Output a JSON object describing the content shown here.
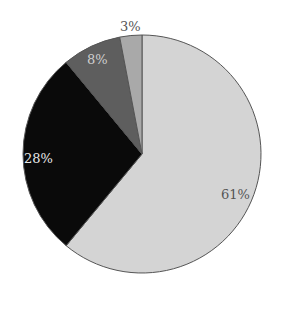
{
  "chart_data": {
    "type": "pie",
    "title": "",
    "start_angle": "12 o'clock",
    "direction": "clockwise",
    "slices": [
      {
        "label": "61%",
        "value": 61,
        "color": "#d4d4d4",
        "label_color": "#555555"
      },
      {
        "label": "28%",
        "value": 28,
        "color": "#0a0a0a",
        "label_color": "#e8e8e8"
      },
      {
        "label": "8%",
        "value": 8,
        "color": "#5e5e5e",
        "label_color": "#cfcfcf"
      },
      {
        "label": "3%",
        "value": 3,
        "color": "#a9a9a9",
        "label_color": "#555555"
      }
    ],
    "legend": null
  },
  "labels": {
    "s0": "61%",
    "s1": "28%",
    "s2": "8%",
    "s3": "3%"
  }
}
